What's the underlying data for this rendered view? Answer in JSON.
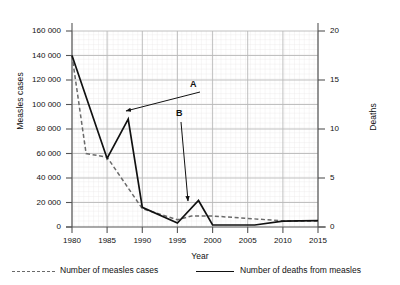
{
  "chart_data": {
    "type": "line",
    "title": "",
    "xlabel": "Year",
    "ylabel": "Measles cases",
    "ylabel_right": "Deaths",
    "xlim": [
      1980,
      2015
    ],
    "ylim": [
      0,
      160000
    ],
    "ylim_right": [
      0,
      20
    ],
    "grid": true,
    "legend_position": "below",
    "x_ticks": [
      "1980",
      "1985",
      "1990",
      "1995",
      "2000",
      "2005",
      "2010",
      "2015"
    ],
    "y_ticks_left": [
      "0",
      "20000",
      "40000",
      "60000",
      "80000",
      "100000",
      "120000",
      "140000",
      "160000"
    ],
    "y_ticks_left_display": [
      "0",
      "20 000",
      "40 000",
      "60 000",
      "80 000",
      "100 000",
      "120 000",
      "140 000",
      "160 000"
    ],
    "y_ticks_right": [
      "0",
      "5",
      "10",
      "15",
      "20"
    ],
    "series": [
      {
        "name": "Number of measles cases",
        "axis": "left",
        "style": "dashed",
        "color": "#6a6a6a",
        "x": [
          1980,
          1982,
          1985,
          1990,
          1995,
          1997,
          2000,
          2005,
          2010,
          2015
        ],
        "values": [
          140000,
          60000,
          57000,
          15000,
          6000,
          9000,
          9000,
          7000,
          5000,
          5000
        ]
      },
      {
        "name": "Number of deaths from measles",
        "axis": "right",
        "style": "solid",
        "color": "#111111",
        "x": [
          1980,
          1985,
          1988,
          1990,
          1995,
          1998,
          2000,
          2006,
          2010,
          2015
        ],
        "values": [
          17.5,
          7.0,
          11.0,
          2.0,
          0.4,
          2.7,
          0.2,
          0.2,
          0.6,
          0.65
        ]
      }
    ],
    "annotations": [
      {
        "label": "A",
        "label_x": 193,
        "label_y": 85,
        "arrow_from_x": 200,
        "arrow_from_y": 92,
        "arrow_to_x": 126,
        "arrow_to_y": 111,
        "describes": "Peak in number of deaths from measles in 1988"
      },
      {
        "label": "B",
        "label_x": 179,
        "label_y": 114,
        "arrow_from_x": 181,
        "arrow_from_y": 122,
        "arrow_to_x": 188,
        "arrow_to_y": 201,
        "describes": "Rise in deaths from measles around 1998"
      }
    ]
  },
  "legend": {
    "entries": [
      {
        "label": "Number of measles cases",
        "style": "dashed"
      },
      {
        "label": "Number of deaths from measles",
        "style": "solid"
      }
    ]
  },
  "colors": {
    "major_grid": "#b9b9b9",
    "minor_grid": "#e8e8e8",
    "axis": "#555555",
    "dashed_series": "#6a6a6a",
    "solid_series": "#111111",
    "text": "#111111"
  }
}
